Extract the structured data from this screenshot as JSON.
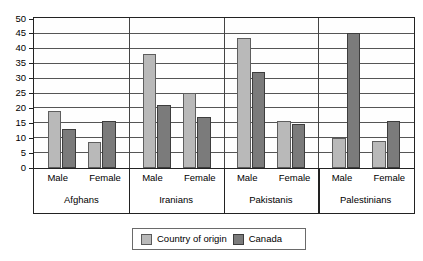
{
  "chart_data": {
    "type": "bar",
    "title": "",
    "subtitle": "",
    "xlabel": "",
    "ylabel": "",
    "ylim": [
      0,
      50
    ],
    "ytick_step": 5,
    "yticks": [
      50,
      45,
      40,
      35,
      30,
      25,
      20,
      15,
      10,
      5,
      0
    ],
    "grid": true,
    "legend_position": "bottom-center",
    "categories": [
      "Afghans - Male",
      "Afghans - Female",
      "Iranians - Male",
      "Iranians - Female",
      "Pakistanis - Male",
      "Pakistanis - Female",
      "Palestinians - Male",
      "Palestinians - Female"
    ],
    "groups": [
      {
        "name": "Afghans",
        "sub": [
          "Male",
          "Female"
        ]
      },
      {
        "name": "Iranians",
        "sub": [
          "Male",
          "Female"
        ]
      },
      {
        "name": "Pakistanis",
        "sub": [
          "Male",
          "Female"
        ]
      },
      {
        "name": "Palestinians",
        "sub": [
          "Male",
          "Female"
        ]
      }
    ],
    "series": [
      {
        "name": "Country of origin",
        "color": "#b9b9b9",
        "values": [
          19,
          8.5,
          38,
          25,
          43.5,
          15.5,
          10,
          9
        ]
      },
      {
        "name": "Canada",
        "color": "#7b7b7b",
        "values": [
          13,
          15.5,
          21,
          17,
          32,
          14.5,
          45,
          15.5
        ]
      }
    ]
  },
  "legend": {
    "items": [
      {
        "label": "Country of origin",
        "swatch": "origin"
      },
      {
        "label": "Canada",
        "swatch": "canada"
      }
    ]
  },
  "axis": {
    "y_labels": [
      "50",
      "45",
      "40",
      "35",
      "30",
      "25",
      "20",
      "15",
      "10",
      "5",
      "0"
    ]
  }
}
